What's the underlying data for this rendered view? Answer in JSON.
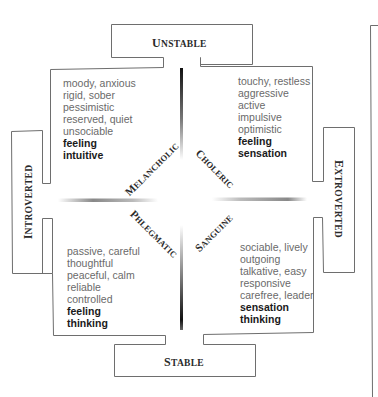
{
  "axes": {
    "top": {
      "first": "U",
      "rest": "NSTABLE"
    },
    "bottom": {
      "first": "S",
      "rest": "TABLE"
    },
    "left": {
      "first": "I",
      "rest": "NTROVERTED"
    },
    "right": {
      "first": "E",
      "rest": "XTROVERTED"
    }
  },
  "temperaments": {
    "melancholic": {
      "first": "M",
      "rest": "ELANCHOLIC"
    },
    "choleric": {
      "first": "C",
      "rest": "HOLERIC"
    },
    "phlegmatic": {
      "first": "P",
      "rest": "HLEGMATIC"
    },
    "sanguine": {
      "first": "S",
      "rest": "ANGUINE"
    }
  },
  "quadrants": {
    "top_left": {
      "traits": [
        "moody, anxious",
        "rigid, sober",
        "pessimistic",
        "reserved, quiet",
        "unsociable"
      ],
      "functions": [
        "feeling",
        "intuitive"
      ]
    },
    "top_right": {
      "traits": [
        "touchy, restless",
        "aggressive",
        "active",
        "impulsive",
        "optimistic"
      ],
      "functions": [
        "feeling",
        "sensation"
      ]
    },
    "bottom_left": {
      "traits": [
        "passive, careful",
        "thoughtful",
        "peaceful, calm",
        "reliable",
        "controlled"
      ],
      "functions": [
        "feeling",
        "thinking"
      ]
    },
    "bottom_right": {
      "traits": [
        "sociable, lively",
        "outgoing",
        "talkative, easy",
        "responsive",
        "carefree, leader"
      ],
      "functions": [
        "sensation",
        "thinking"
      ]
    }
  },
  "colors": {
    "line": "#6e6e6e",
    "axis_dark": "#1a1a1a",
    "trait_text": "#6a6a6a",
    "function_text": "#1a1a1a"
  }
}
